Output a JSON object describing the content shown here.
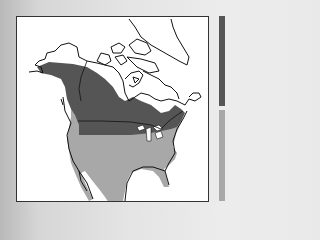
{
  "map": {
    "subject": "North America range map",
    "regions": [
      {
        "name": "northern-range",
        "color": "#555555"
      },
      {
        "name": "southern-range",
        "color": "#a8a8a8"
      }
    ],
    "land_outline_color": "#111111",
    "water_color": "#ffffff"
  },
  "legend": {
    "items": [
      {
        "name": "dark-range-swatch",
        "color": "#555555"
      },
      {
        "name": "light-range-swatch",
        "color": "#a8a8a8"
      }
    ]
  }
}
